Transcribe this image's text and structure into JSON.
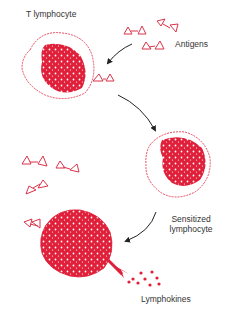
{
  "diagram": {
    "labels": {
      "t_lymphocyte": "T lymphocyte",
      "antigens": "Antigens",
      "sensitized_line1": "Sensitized",
      "sensitized_line2": "lymphocyte",
      "lymphokines": "Lymphokines"
    },
    "colors": {
      "cell_red": "#e0203a",
      "antigen_outline": "#d9334a",
      "arrow": "#222222",
      "text": "#333333"
    },
    "stages": [
      "T lymphocyte encounters antigens",
      "Sensitized lymphocyte",
      "Sensitized lymphocyte binds antigen and releases lymphokines"
    ]
  }
}
